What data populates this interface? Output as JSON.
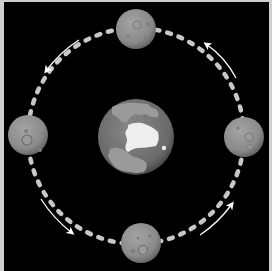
{
  "diagram": {
    "title": "",
    "description_labels": [],
    "background_color": "#000000",
    "border_color": "#cfcfcf",
    "orbit": {
      "center": [
        136,
        136
      ],
      "radius": 108,
      "style": "dashed",
      "color": "#c8c8c8",
      "direction": "counter-clockwise"
    },
    "earth": {
      "center": [
        136,
        137
      ],
      "radius": 38,
      "ocean_color": "#6e6e6e",
      "land_color": "#9a9a9a",
      "ice_color": "#f0f0f0"
    },
    "moons": [
      {
        "position": "top",
        "center": [
          136,
          29
        ],
        "radius": 20
      },
      {
        "position": "left",
        "center": [
          28,
          135
        ],
        "radius": 20
      },
      {
        "position": "right",
        "center": [
          244,
          137
        ],
        "radius": 20
      },
      {
        "position": "bottom",
        "center": [
          141,
          243
        ],
        "radius": 20
      }
    ],
    "moon_color": "#8a8a8a",
    "arrows": [
      {
        "quadrant": "top-left",
        "direction": "counter-clockwise"
      },
      {
        "quadrant": "bottom-left",
        "direction": "counter-clockwise"
      },
      {
        "quadrant": "bottom-right",
        "direction": "counter-clockwise"
      },
      {
        "quadrant": "top-right",
        "direction": "counter-clockwise"
      }
    ],
    "arrow_color": "#ffffff"
  }
}
